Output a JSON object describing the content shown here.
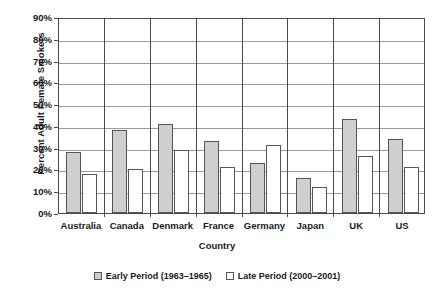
{
  "chart_data": {
    "type": "bar",
    "title": "",
    "xlabel": "Country",
    "ylabel": "Percent Adult Female Smokers",
    "categories": [
      "Australia",
      "Canada",
      "Denmark",
      "France",
      "Germany",
      "Japan",
      "UK",
      "US"
    ],
    "series": [
      {
        "name": "Early Period (1963–1965)",
        "color": "#cfcfcf",
        "values": [
          28,
          38,
          41,
          33,
          23,
          16,
          43,
          34
        ]
      },
      {
        "name": "Late Period (2000–2001)",
        "color": "#ffffff",
        "values": [
          18,
          20,
          29,
          21,
          31,
          12,
          26,
          21
        ]
      }
    ],
    "ylim": [
      0,
      90
    ],
    "ytick_labels": [
      "0%",
      "10%",
      "20%",
      "30%",
      "40%",
      "50%",
      "60%",
      "70%",
      "80%",
      "90%"
    ],
    "ytick_values": [
      0,
      10,
      20,
      30,
      40,
      50,
      60,
      70,
      80,
      90
    ],
    "grid": true,
    "legend_position": "bottom"
  }
}
